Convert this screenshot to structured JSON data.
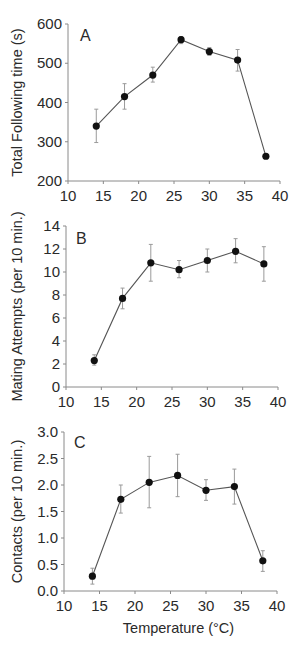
{
  "chart_data": [
    {
      "type": "line",
      "panel": "A",
      "title": "",
      "xlabel": "",
      "ylabel": "Total Following time (s)",
      "x": [
        14,
        18,
        22,
        26,
        30,
        34,
        38
      ],
      "series": [
        {
          "name": "Total Following time",
          "values": [
            340,
            415,
            470,
            560,
            530,
            508,
            263
          ],
          "error_low": [
            298,
            383,
            452,
            550,
            520,
            480,
            263
          ],
          "error_high": [
            383,
            448,
            490,
            568,
            540,
            535,
            263
          ]
        }
      ],
      "xlim": [
        10,
        40
      ],
      "ylim": [
        200,
        600
      ],
      "xticks": [
        10,
        15,
        20,
        25,
        30,
        35,
        40
      ],
      "yticks": [
        200,
        300,
        400,
        500,
        600
      ],
      "ytick_labels": [
        "200",
        "300",
        "400",
        "500",
        "600"
      ],
      "grid": false,
      "legend": "none"
    },
    {
      "type": "line",
      "panel": "B",
      "title": "",
      "xlabel": "",
      "ylabel": "Mating Attempts (per 10 min.)",
      "x": [
        14,
        18,
        22,
        26,
        30,
        34,
        38
      ],
      "series": [
        {
          "name": "Mating Attempts",
          "values": [
            2.3,
            7.7,
            10.8,
            10.2,
            11.0,
            11.8,
            10.7
          ],
          "error_low": [
            1.9,
            6.8,
            9.2,
            9.5,
            10.0,
            10.8,
            9.2
          ],
          "error_high": [
            2.8,
            8.6,
            12.4,
            11.0,
            12.0,
            12.9,
            12.2
          ]
        }
      ],
      "xlim": [
        10,
        40
      ],
      "ylim": [
        0,
        14
      ],
      "xticks": [
        10,
        15,
        20,
        25,
        30,
        35,
        40
      ],
      "yticks": [
        0,
        2,
        4,
        6,
        8,
        10,
        12,
        14
      ],
      "ytick_labels": [
        "0",
        "2",
        "4",
        "6",
        "8",
        "10",
        "12",
        "14"
      ],
      "grid": false,
      "legend": "none"
    },
    {
      "type": "line",
      "panel": "C",
      "title": "",
      "xlabel": "Temperature (°C)",
      "ylabel": "Contacts (per 10 min.)",
      "x": [
        14,
        18,
        22,
        26,
        30,
        34,
        38
      ],
      "series": [
        {
          "name": "Contacts",
          "values": [
            0.28,
            1.73,
            2.05,
            2.18,
            1.9,
            1.97,
            0.57
          ],
          "error_low": [
            0.13,
            1.47,
            1.57,
            1.78,
            1.71,
            1.64,
            0.37
          ],
          "error_high": [
            0.43,
            2.0,
            2.54,
            2.58,
            2.1,
            2.3,
            0.76
          ]
        }
      ],
      "xlim": [
        10,
        40
      ],
      "ylim": [
        0,
        3.0
      ],
      "xticks": [
        10,
        15,
        20,
        25,
        30,
        35,
        40
      ],
      "yticks": [
        0,
        0.5,
        1.0,
        1.5,
        2.0,
        2.5,
        3.0
      ],
      "ytick_labels": [
        "0.0",
        "0.5",
        "1.0",
        "1.5",
        "2.0",
        "2.5",
        "3.0"
      ],
      "grid": false,
      "legend": "none"
    }
  ],
  "layout": {
    "panels": [
      {
        "x0": 68,
        "x1": 280,
        "y_top": 24,
        "y_bottom": 181,
        "ylabel_x": 22,
        "letter_x": 80,
        "letter_y": 41
      },
      {
        "x0": 66,
        "x1": 278,
        "y_top": 226,
        "y_bottom": 387,
        "ylabel_x": 22,
        "letter_x": 76,
        "letter_y": 244
      },
      {
        "x0": 64,
        "x1": 277,
        "y_top": 432,
        "y_bottom": 591,
        "ylabel_x": 22,
        "letter_x": 74,
        "letter_y": 448
      }
    ],
    "xlabel_y": 633
  }
}
